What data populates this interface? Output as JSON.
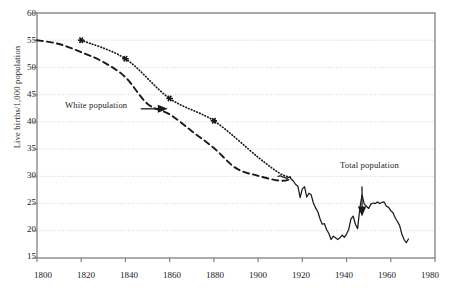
{
  "chart_data": {
    "type": "line",
    "title": "",
    "xlabel": "",
    "ylabel": "Live births/1,000 population",
    "xlim": [
      1800,
      1980
    ],
    "ylim": [
      15,
      60
    ],
    "xticks": [
      1800,
      1820,
      1840,
      1860,
      1880,
      1900,
      1920,
      1940,
      1960,
      1980
    ],
    "yticks": [
      15,
      20,
      25,
      30,
      35,
      40,
      45,
      50,
      55,
      60
    ],
    "grid": "horizontal dotted light-gray",
    "legend_position": "inline annotations with arrows",
    "annotations": [
      {
        "text": "White population",
        "x": 1837,
        "y": 42.4,
        "arrow": "right",
        "points_to_series": "white_population_dashed"
      },
      {
        "text": "Total population",
        "x": 1947,
        "y": 29.6,
        "arrow": "down",
        "points_to_series": "total_population_solid"
      }
    ],
    "series": [
      {
        "name": "white_population_dashed",
        "style": "dashed",
        "marker": "none",
        "x": [
          1800,
          1810,
          1820,
          1830,
          1840,
          1850,
          1860,
          1870,
          1880,
          1890,
          1900,
          1910,
          1915
        ],
        "values": [
          55.0,
          54.3,
          52.8,
          51.0,
          48.2,
          43.3,
          41.4,
          38.3,
          35.2,
          31.5,
          30.1,
          29.2,
          29.5
        ]
      },
      {
        "name": "white_population_dotted_markers",
        "style": "dotted",
        "marker": "star",
        "x": [
          1820,
          1840,
          1860,
          1880,
          1900,
          1910,
          1915
        ],
        "values": [
          55.0,
          51.6,
          44.3,
          40.2,
          33.5,
          30.5,
          29.8
        ]
      },
      {
        "name": "total_population_solid",
        "style": "solid",
        "marker": "none",
        "x": [
          1909,
          1910,
          1911,
          1912,
          1913,
          1914,
          1915,
          1916,
          1917,
          1918,
          1919,
          1920,
          1921,
          1922,
          1923,
          1924,
          1925,
          1926,
          1927,
          1928,
          1929,
          1930,
          1931,
          1932,
          1933,
          1934,
          1935,
          1936,
          1937,
          1938,
          1939,
          1940,
          1941,
          1942,
          1943,
          1944,
          1945,
          1946,
          1947,
          1948,
          1949,
          1950,
          1951,
          1952,
          1953,
          1954,
          1955,
          1956,
          1957,
          1958,
          1959,
          1960,
          1961,
          1962,
          1963,
          1964,
          1965,
          1966,
          1967,
          1968
        ],
        "values": [
          30.0,
          30.1,
          29.9,
          29.8,
          29.6,
          29.9,
          29.5,
          29.1,
          28.5,
          28.2,
          26.1,
          27.7,
          28.1,
          26.2,
          26.9,
          26.6,
          25.1,
          24.2,
          23.5,
          22.2,
          21.2,
          21.3,
          20.2,
          19.5,
          18.4,
          19.0,
          18.7,
          18.4,
          18.7,
          19.2,
          18.8,
          19.4,
          20.3,
          22.2,
          22.7,
          21.2,
          20.4,
          24.1,
          26.6,
          24.9,
          24.5,
          24.1,
          24.9,
          25.1,
          25.0,
          25.3,
          25.0,
          25.2,
          25.3,
          24.5,
          24.3,
          23.7,
          23.3,
          22.4,
          21.7,
          21.0,
          19.4,
          18.4,
          17.8,
          18.5
        ]
      }
    ]
  },
  "axis": {
    "x_tick_labels": [
      "1800",
      "1820",
      "1840",
      "1860",
      "1880",
      "1900",
      "1920",
      "1940",
      "1960",
      "1980"
    ],
    "y_tick_labels": [
      "15",
      "20",
      "25",
      "30",
      "35",
      "40",
      "45",
      "50",
      "55",
      "60"
    ],
    "y_axis_title": "Live births/1,000 population"
  },
  "labels": {
    "white_population": "White population",
    "total_population": "Total population"
  },
  "colors": {
    "line": "#1a1a1a",
    "grid": "#c8c8c8",
    "frame": "#808080",
    "background": "#ffffff"
  }
}
